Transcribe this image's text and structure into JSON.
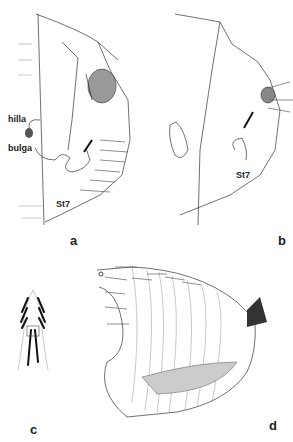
{
  "figure": {
    "panels": [
      {
        "id": "a",
        "label": "a",
        "annotations": [
          "hilla",
          "bulga",
          "St7"
        ]
      },
      {
        "id": "b",
        "label": "b",
        "annotations": [
          "St7"
        ]
      },
      {
        "id": "c",
        "label": "c",
        "annotations": []
      },
      {
        "id": "d",
        "label": "d",
        "annotations": []
      }
    ]
  }
}
